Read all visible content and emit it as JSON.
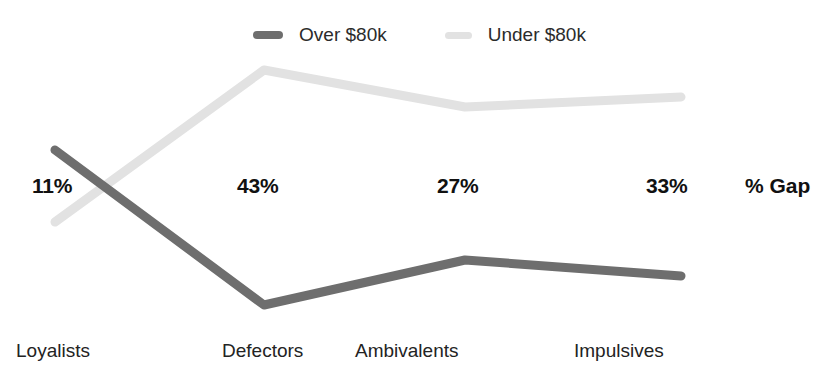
{
  "clipped_header": {
    "text": " "
  },
  "legend": {
    "position": "top-center",
    "entries": [
      {
        "label": "Over $80k",
        "color": "#6e6e6e",
        "icon": "line-swatch-icon"
      },
      {
        "label": "Under $80k",
        "color": "#e2e2e2",
        "icon": "line-swatch-icon"
      }
    ]
  },
  "annotations": {
    "gap_series_label": "% Gap"
  },
  "chart_data": {
    "type": "line",
    "title": "",
    "subtitle": "",
    "xlabel": "",
    "ylabel": "",
    "grid": false,
    "legend_position": "top-center",
    "categories": [
      "Loyalists",
      "Defectors",
      "Ambivalents",
      "Impulsives"
    ],
    "series": [
      {
        "name": "Over $80k",
        "color": "#6e6e6e",
        "values": [
          62,
          21,
          32,
          29
        ]
      },
      {
        "name": "Under $80k",
        "color": "#e2e2e2",
        "values": [
          51,
          64,
          59,
          62
        ]
      }
    ],
    "gap_labels": [
      "11%",
      "43%",
      "27%",
      "33%"
    ],
    "gap_values": [
      11,
      43,
      27,
      33
    ],
    "ylim": [
      0,
      100
    ]
  },
  "geometry": {
    "x_positions": [
      55,
      264,
      465,
      681
    ],
    "over_y": [
      150,
      305,
      260,
      276
    ],
    "under_y": [
      222,
      70,
      107,
      97
    ],
    "gap_label_x": [
      32,
      237,
      437,
      646
    ],
    "gap_label_y": 174,
    "annotation_x": 745,
    "cat_label_x": [
      16,
      222,
      355,
      574
    ]
  }
}
